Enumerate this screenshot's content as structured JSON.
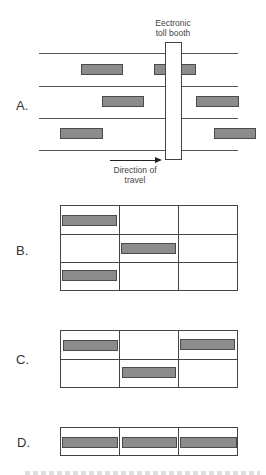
{
  "panel_a": {
    "label": "A.",
    "booth_label_line1": "Eectronic",
    "booth_label_line2": "toll booth",
    "direction_line1": "Direction of",
    "direction_line2": "travel"
  },
  "panel_b": {
    "label": "B."
  },
  "panel_c": {
    "label": "C."
  },
  "panel_d": {
    "label": "D."
  },
  "colors": {
    "car_fill": "#8c8c8c",
    "car_border": "#4a4a4a",
    "line": "#444444",
    "background": "#ffffff"
  },
  "diagram": {
    "panel_b_grid": {
      "rows": 3,
      "cols": 3,
      "occupied": [
        [
          0,
          0
        ],
        [
          1,
          1
        ],
        [
          2,
          0
        ]
      ]
    },
    "panel_c_grid": {
      "rows": 2,
      "cols": 3,
      "occupied": [
        [
          0,
          0
        ],
        [
          0,
          2
        ],
        [
          1,
          1
        ]
      ]
    },
    "panel_d_grid": {
      "rows": 1,
      "cols": 3,
      "occupied": [
        [
          0,
          0
        ],
        [
          0,
          1
        ],
        [
          0,
          2
        ]
      ]
    }
  }
}
